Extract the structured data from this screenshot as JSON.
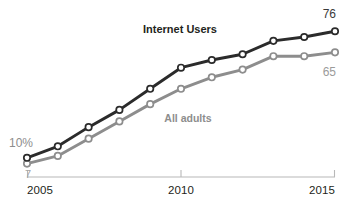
{
  "chart_data": {
    "type": "line",
    "title": "",
    "subtitle": "",
    "xlabel": "",
    "ylabel": "",
    "x": [
      2005,
      2006,
      2007,
      2008,
      2009,
      2010,
      2011,
      2012,
      2013,
      2014,
      2015
    ],
    "xlim": [
      2005,
      2015
    ],
    "ylim": [
      0,
      85
    ],
    "grid": false,
    "legend_position": "inline-annotation",
    "xtick_labels": [
      "2005",
      "2010",
      "2015"
    ],
    "xtick_values": [
      2005,
      2010,
      2015
    ],
    "ytick_labels": [],
    "series": [
      {
        "name": "Internet Users",
        "color": "#2b2b2b",
        "values": [
          10,
          16,
          26,
          35,
          46,
          57,
          61,
          64,
          71,
          73,
          76
        ],
        "start_label": "10%",
        "end_label": "76"
      },
      {
        "name": "All adults",
        "color": "#8d8d8d",
        "values": [
          7,
          11,
          20,
          29,
          38,
          46,
          52,
          56,
          63,
          63,
          65
        ],
        "start_label": "7",
        "end_label": "65"
      }
    ],
    "annotations": [
      {
        "text": "Internet Users",
        "series": "Internet Users",
        "style": "bold-dark"
      },
      {
        "text": "All adults",
        "series": "All adults",
        "style": "bold-gray"
      }
    ]
  },
  "axis": {
    "x_start_label": "2005",
    "x_mid_label": "2010",
    "x_end_label": "2015",
    "axis_color": "#b8b8b8"
  },
  "labels": {
    "series_dark_name": "Internet Users",
    "series_gray_name": "All adults",
    "dark_start_value": "10%",
    "dark_end_value": "76",
    "gray_start_value": "7",
    "gray_end_value": "65"
  },
  "colors": {
    "dark_series": "#2b2b2b",
    "gray_series": "#8d8d8d",
    "axis": "#b8b8b8",
    "background": "#ffffff"
  }
}
